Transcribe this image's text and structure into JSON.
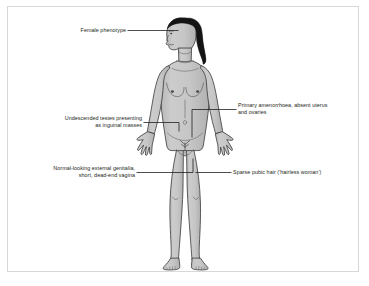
{
  "diagram": {
    "type": "labelled-anatomical-illustration",
    "background_color": "#ffffff",
    "border_color": "#d8d8d8",
    "body_fill_color": "#c9c9c9",
    "body_shade_color": "#b3b3b3",
    "outline_color": "#3a3a3a",
    "hair_color": "#1a1a1a",
    "leader_line_color": "#231f20",
    "text_color": "#231f20",
    "labels": [
      {
        "id": "female-phenotype",
        "text": "Female phenotype",
        "side": "left",
        "points_to": "head"
      },
      {
        "id": "undescended-testes",
        "text": "Undescended testes presenting\nas inguinal masses",
        "side": "left",
        "points_to": "right inguinal region"
      },
      {
        "id": "external-genitalia",
        "text": "Normal-looking external genitalia,\nshort, dead-end vagina",
        "side": "left",
        "points_to": "vulva"
      },
      {
        "id": "primary-amenorrhoea",
        "text": "Primary amenorrhoea, absent uterus\nand ovaries",
        "side": "right",
        "points_to": "lower abdomen"
      },
      {
        "id": "sparse-pubic-hair",
        "text": "Sparse pubic hair ('hairless woman')",
        "side": "right",
        "points_to": "pubic region"
      }
    ]
  }
}
